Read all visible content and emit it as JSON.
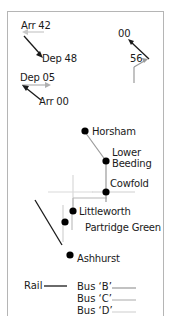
{
  "timings": {
    "west_upper": {
      "arr": "Arr 42",
      "dep": "Dep 48"
    },
    "west_lower": {
      "dep": "Dep 05",
      "arr": "Arr 00"
    },
    "north_east": {
      "dep": "00",
      "arr": "56"
    }
  },
  "stations": [
    {
      "id": "horsham",
      "label": "Horsham"
    },
    {
      "id": "lower-beeding",
      "label": "Lower",
      "label2": "Beeding"
    },
    {
      "id": "cowfold",
      "label": "Cowfold"
    },
    {
      "id": "littleworth",
      "label": "Littleworth"
    },
    {
      "id": "partridge-green",
      "label": "Partridge Green"
    },
    {
      "id": "ashhurst",
      "label": "Ashhurst"
    }
  ],
  "legend": {
    "rail": "Rail",
    "bus_b": "Bus ‘B’",
    "bus_c": "Bus ‘C’",
    "bus_d": "Bus ‘D’"
  },
  "colors": {
    "rail": "#1a1a1a",
    "bus_b": "#9a9a9a",
    "bus_c": "#b8b8b8",
    "bus_d": "#d6d6d6",
    "station": "#000000",
    "frame": "#b5b5b5"
  }
}
